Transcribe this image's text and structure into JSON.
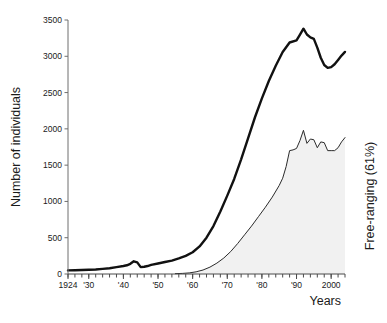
{
  "chart_data": {
    "type": "line",
    "title": "",
    "xlabel": "Years",
    "ylabel": "Number of individuals",
    "right_label": "Free-ranging (61%)",
    "xlim": [
      1924,
      2004
    ],
    "ylim": [
      0,
      3500
    ],
    "grid": false,
    "legend": "none",
    "y_ticks": [
      0,
      500,
      1000,
      1500,
      2000,
      2500,
      3000,
      3500
    ],
    "y_tick_labels": [
      "0",
      "500",
      "1000",
      "1500",
      "2000",
      "2500",
      "3000",
      "3500"
    ],
    "x_ticks": [
      1924,
      1930,
      1940,
      1950,
      1960,
      1970,
      1980,
      1990,
      2000
    ],
    "x_tick_labels": [
      "1924",
      "'30",
      "'40",
      "'50",
      "'60",
      "'70",
      "'80",
      "'90",
      "2000"
    ],
    "x_minor_tick_step": 2,
    "colors": {
      "total_line": "#111111",
      "free_line": "#2b2b2b",
      "free_fill": "#f1f1f1",
      "axis": "#6e6e6e",
      "text": "#1a1a1a"
    },
    "series": [
      {
        "name": "Total",
        "style": "thick-line",
        "x": [
          1924,
          1926,
          1928,
          1930,
          1932,
          1934,
          1936,
          1938,
          1940,
          1941,
          1942,
          1943,
          1944,
          1945,
          1946,
          1947,
          1948,
          1950,
          1952,
          1954,
          1956,
          1958,
          1960,
          1962,
          1964,
          1966,
          1968,
          1970,
          1972,
          1974,
          1976,
          1978,
          1980,
          1982,
          1984,
          1986,
          1988,
          1990,
          1991,
          1992,
          1993,
          1994,
          1995,
          1996,
          1997,
          1998,
          1999,
          2000,
          2001,
          2002,
          2003,
          2004
        ],
        "values": [
          50,
          52,
          55,
          58,
          62,
          70,
          80,
          95,
          110,
          120,
          140,
          175,
          160,
          95,
          100,
          110,
          125,
          145,
          165,
          185,
          215,
          250,
          300,
          380,
          500,
          660,
          860,
          1080,
          1310,
          1580,
          1870,
          2160,
          2420,
          2660,
          2870,
          3060,
          3190,
          3220,
          3300,
          3380,
          3300,
          3260,
          3240,
          3120,
          2980,
          2880,
          2840,
          2850,
          2890,
          2950,
          3010,
          3060
        ]
      },
      {
        "name": "Free-ranging",
        "style": "thin-line-filled",
        "percent_of_total": 61,
        "x": [
          1955,
          1957,
          1959,
          1961,
          1963,
          1965,
          1967,
          1969,
          1971,
          1973,
          1975,
          1977,
          1979,
          1981,
          1983,
          1985,
          1986,
          1987,
          1988,
          1989,
          1990,
          1991,
          1992,
          1993,
          1994,
          1995,
          1996,
          1997,
          1998,
          1999,
          2000,
          2001,
          2002,
          2003,
          2004
        ],
        "values": [
          5,
          8,
          15,
          30,
          55,
          95,
          150,
          220,
          310,
          420,
          540,
          660,
          790,
          920,
          1060,
          1220,
          1320,
          1480,
          1700,
          1710,
          1730,
          1840,
          1980,
          1800,
          1860,
          1850,
          1740,
          1820,
          1810,
          1700,
          1700,
          1700,
          1740,
          1820,
          1880
        ]
      }
    ]
  }
}
